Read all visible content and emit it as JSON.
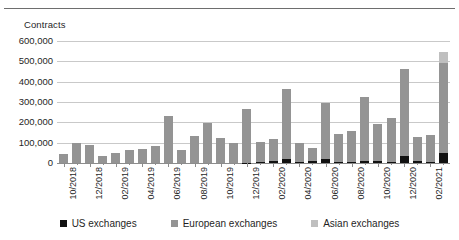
{
  "chart_data": {
    "type": "bar",
    "title": "",
    "subtitle": "",
    "xlabel": "",
    "ylabel": "Contracts",
    "stacked": true,
    "grid": true,
    "legend_position": "bottom",
    "ylim": [
      0,
      600000
    ],
    "ytick_labels": [
      "600,000",
      "500,000",
      "400,000",
      "300,000",
      "200,000",
      "100,000",
      "0"
    ],
    "ytick_values": [
      600000,
      500000,
      400000,
      300000,
      200000,
      100000,
      0
    ],
    "categories": [
      "10/2018",
      "11/2018",
      "12/2018",
      "01/2019",
      "02/2019",
      "03/2019",
      "04/2019",
      "05/2019",
      "06/2019",
      "07/2019",
      "08/2019",
      "09/2019",
      "10/2019",
      "11/2019",
      "12/2019",
      "01/2020",
      "02/2020",
      "03/2020",
      "04/2020",
      "05/2020",
      "06/2020",
      "07/2020",
      "08/2020",
      "09/2020",
      "10/2020",
      "11/2020",
      "12/2020",
      "01/2021",
      "02/2021",
      "03/2021"
    ],
    "visible_tick_labels": [
      "10/2018",
      "12/2018",
      "02/2019",
      "04/2019",
      "06/2019",
      "08/2019",
      "10/2019",
      "12/2019",
      "02/2020",
      "04/2020",
      "06/2020",
      "08/2020",
      "10/2020",
      "12/2020",
      "02/2021"
    ],
    "series": [
      {
        "name": "US exchanges",
        "color": "#111111",
        "values": [
          0,
          0,
          0,
          0,
          0,
          0,
          0,
          0,
          0,
          0,
          0,
          0,
          0,
          0,
          2000,
          3000,
          12000,
          18000,
          3000,
          8000,
          18000,
          3000,
          3000,
          11000,
          11000,
          5000,
          33000,
          8000,
          7000,
          48000
        ]
      },
      {
        "name": "European exchanges",
        "color": "#949494",
        "values": [
          44000,
          97000,
          88000,
          34000,
          48000,
          65000,
          71000,
          83000,
          232000,
          65000,
          132000,
          198000,
          124000,
          97000,
          263000,
          98000,
          108000,
          344000,
          94000,
          67000,
          276000,
          138000,
          152000,
          314000,
          183000,
          218000,
          427000,
          118000,
          132000,
          443000
        ]
      },
      {
        "name": "Asian exchanges",
        "color": "#bfbfbf",
        "values": [
          0,
          0,
          0,
          0,
          0,
          0,
          0,
          0,
          0,
          0,
          0,
          0,
          0,
          0,
          0,
          0,
          0,
          0,
          0,
          0,
          0,
          0,
          0,
          0,
          0,
          0,
          0,
          0,
          0,
          57000
        ]
      }
    ],
    "totals": [
      44000,
      97000,
      88000,
      34000,
      48000,
      65000,
      71000,
      83000,
      232000,
      65000,
      132000,
      198000,
      124000,
      97000,
      265000,
      101000,
      120000,
      362000,
      97000,
      75000,
      294000,
      141000,
      155000,
      325000,
      194000,
      223000,
      460000,
      126000,
      139000,
      548000
    ]
  },
  "legend": {
    "items": [
      {
        "label": "US exchanges",
        "color": "#111111"
      },
      {
        "label": "European exchanges",
        "color": "#949494"
      },
      {
        "label": "Asian exchanges",
        "color": "#bfbfbf"
      }
    ]
  }
}
